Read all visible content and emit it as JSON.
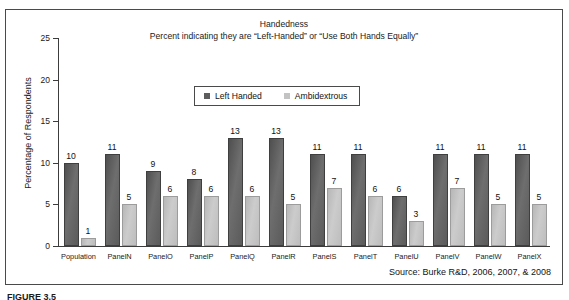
{
  "top_bleed_text": "▁▁▁▁▁▁▁▁▁▁▁▁▁▁▁▁▁▁▁▁▁▁▁▁▁▁▁▁▁▁",
  "figure_caption": "FIGURE 3.5",
  "source_note": "Source: Burke R&D, 2006, 2007, & 2008",
  "legend": {
    "entries": [
      {
        "label": "Left Handed",
        "color": "#5d5d5d"
      },
      {
        "label": "Ambidextrous",
        "color": "#c3c3c3"
      }
    ]
  },
  "chart_data": {
    "type": "bar",
    "title": "Handedness",
    "subtitle": "Percent indicating they are “Left-Handed” or “Use Both Hands Equally”",
    "xlabel": "",
    "ylabel": "Percentage of Respondents",
    "ylim": [
      0,
      25
    ],
    "yticks": [
      0,
      5,
      10,
      15,
      20,
      25
    ],
    "grid": false,
    "legend_position": "top-center",
    "categories": [
      "Population",
      "PanelN",
      "PanelO",
      "PanelP",
      "PanelQ",
      "PanelR",
      "PanelS",
      "PanelT",
      "PanelU",
      "PanelV",
      "PanelW",
      "PanelX"
    ],
    "series": [
      {
        "name": "Left Handed",
        "color": "#5d5d5d",
        "values": [
          10,
          11,
          9,
          8,
          13,
          13,
          11,
          11,
          6,
          11,
          11,
          11
        ]
      },
      {
        "name": "Ambidextrous",
        "color": "#c3c3c3",
        "values": [
          1,
          5,
          6,
          6,
          6,
          5,
          7,
          6,
          3,
          7,
          5,
          5
        ]
      }
    ],
    "source": "Source: Burke R&D, 2006, 2007, & 2008"
  }
}
